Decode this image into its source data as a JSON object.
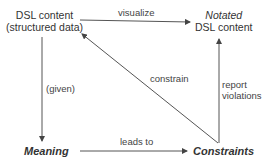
{
  "diagram": {
    "nodes": {
      "dsl_content": {
        "line1": "DSL content",
        "line2": "(structured data)"
      },
      "notated": {
        "line1": "Notated",
        "line2": "DSL content"
      },
      "meaning": {
        "label": "Meaning"
      },
      "constraints": {
        "label": "Constraints"
      }
    },
    "edges": {
      "visualize": {
        "label": "visualize",
        "from": "DSL content",
        "to": "Notated DSL content"
      },
      "given": {
        "label": "(given)",
        "from": "DSL content",
        "to": "Meaning"
      },
      "leads_to": {
        "label": "leads to",
        "from": "Meaning",
        "to": "Constraints"
      },
      "constrain": {
        "label": "constrain",
        "from": "Constraints",
        "to": "DSL content"
      },
      "report_violations": {
        "line1": "report",
        "line2": "violations",
        "from": "Constraints",
        "to": "Notated DSL content"
      }
    },
    "colors": {
      "line": "#555555",
      "text": "#333333"
    }
  }
}
